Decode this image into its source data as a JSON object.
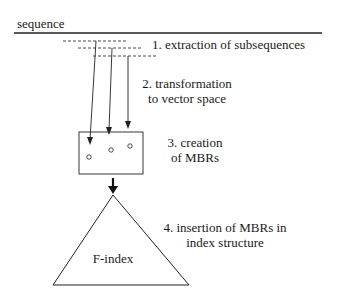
{
  "sequence_label": "sequence",
  "steps": [
    {
      "id": 1,
      "text": "1. extraction of subsequences"
    },
    {
      "id": 2,
      "line1": "2. transformation",
      "line2": "to vector space"
    },
    {
      "id": 3,
      "line1": "3. creation",
      "line2": "of MBRs"
    },
    {
      "id": 4,
      "line1": "4. insertion of MBRs in",
      "line2": "index structure"
    }
  ],
  "index_label": "F-index",
  "colors": {
    "line": "#222222",
    "background": "#ffffff"
  }
}
